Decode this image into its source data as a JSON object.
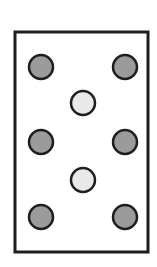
{
  "figure": {
    "colors": {
      "background": "#ffffff",
      "stroke": "#1e1e1e",
      "dark_dot": "#9b9b9b",
      "light_dot": "#e9e9e9"
    },
    "frame": {
      "x": 15,
      "y": 32,
      "width": 133,
      "height": 220
    },
    "dots": [
      {
        "type": "dark",
        "cx": 41,
        "cy": 67
      },
      {
        "type": "dark",
        "cx": 125,
        "cy": 67
      },
      {
        "type": "light",
        "cx": 83,
        "cy": 103
      },
      {
        "type": "dark",
        "cx": 41,
        "cy": 142
      },
      {
        "type": "dark",
        "cx": 125,
        "cy": 142
      },
      {
        "type": "light",
        "cx": 83,
        "cy": 180
      },
      {
        "type": "dark",
        "cx": 41,
        "cy": 217
      },
      {
        "type": "dark",
        "cx": 125,
        "cy": 217
      }
    ],
    "dot_radius": 12
  }
}
